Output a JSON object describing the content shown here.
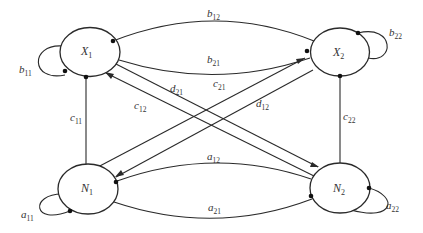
{
  "diagram": {
    "type": "directed-graph",
    "nodes": [
      {
        "id": "X1",
        "base": "X",
        "sub": "1"
      },
      {
        "id": "X2",
        "base": "X",
        "sub": "2"
      },
      {
        "id": "N1",
        "base": "N",
        "sub": "1"
      },
      {
        "id": "N2",
        "base": "N",
        "sub": "2"
      }
    ],
    "edges": [
      {
        "id": "b11",
        "base": "b",
        "sub": "11",
        "from": "X1",
        "to": "X1",
        "kind": "self-loop"
      },
      {
        "id": "b12",
        "base": "b",
        "sub": "12",
        "from": "X1",
        "to": "X2",
        "kind": "curve"
      },
      {
        "id": "b21",
        "base": "b",
        "sub": "21",
        "from": "X2",
        "to": "X1",
        "kind": "curve"
      },
      {
        "id": "b22",
        "base": "b",
        "sub": "22",
        "from": "X2",
        "to": "X2",
        "kind": "self-loop"
      },
      {
        "id": "c11",
        "base": "c",
        "sub": "11",
        "from": "N1",
        "to": "X1",
        "kind": "line"
      },
      {
        "id": "c12",
        "base": "c",
        "sub": "12",
        "from": "N2",
        "to": "X1",
        "kind": "line"
      },
      {
        "id": "c21",
        "base": "c",
        "sub": "21",
        "from": "N1",
        "to": "X2",
        "kind": "line"
      },
      {
        "id": "c22",
        "base": "c",
        "sub": "22",
        "from": "N2",
        "to": "X2",
        "kind": "line"
      },
      {
        "id": "d12",
        "base": "d",
        "sub": "12",
        "from": "X2",
        "to": "N1",
        "kind": "line"
      },
      {
        "id": "d21",
        "base": "d",
        "sub": "21",
        "from": "X1",
        "to": "N2",
        "kind": "line"
      },
      {
        "id": "a11",
        "base": "a",
        "sub": "11",
        "from": "N1",
        "to": "N1",
        "kind": "self-loop"
      },
      {
        "id": "a12",
        "base": "a",
        "sub": "12",
        "from": "N1",
        "to": "N2",
        "kind": "curve"
      },
      {
        "id": "a21",
        "base": "a",
        "sub": "21",
        "from": "N2",
        "to": "N1",
        "kind": "curve"
      },
      {
        "id": "a22",
        "base": "a",
        "sub": "22",
        "from": "N2",
        "to": "N2",
        "kind": "self-loop"
      }
    ]
  },
  "labels": {
    "X1": {
      "base": "X",
      "sub": "1"
    },
    "X2": {
      "base": "X",
      "sub": "2"
    },
    "N1": {
      "base": "N",
      "sub": "1"
    },
    "N2": {
      "base": "N",
      "sub": "2"
    },
    "b11": {
      "base": "b",
      "sub": "11"
    },
    "b12": {
      "base": "b",
      "sub": "12"
    },
    "b21": {
      "base": "b",
      "sub": "21"
    },
    "b22": {
      "base": "b",
      "sub": "22"
    },
    "c11": {
      "base": "c",
      "sub": "11"
    },
    "c12": {
      "base": "c",
      "sub": "12"
    },
    "c21": {
      "base": "c",
      "sub": "21"
    },
    "c22": {
      "base": "c",
      "sub": "22"
    },
    "d12": {
      "base": "d",
      "sub": "12"
    },
    "d21": {
      "base": "d",
      "sub": "21"
    },
    "a11": {
      "base": "a",
      "sub": "11"
    },
    "a12": {
      "base": "a",
      "sub": "12"
    },
    "a21": {
      "base": "a",
      "sub": "21"
    },
    "a22": {
      "base": "a",
      "sub": "22"
    }
  },
  "colors": {
    "stroke": "#2a2a2a",
    "text": "#333333",
    "background": "#ffffff"
  }
}
